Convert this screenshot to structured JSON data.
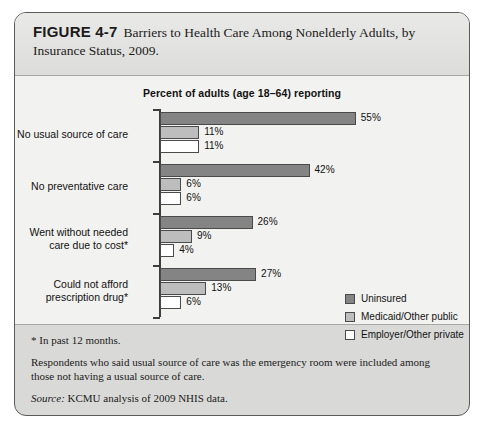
{
  "figure": {
    "number": "FIGURE 4-7",
    "caption": "Barriers to Health Care Among Nonelderly Adults, by Insurance Status, 2009."
  },
  "notes": {
    "footnote": "* In past 12 months.",
    "methodology": "Respondents who said usual source of care was the emergency room were included among those not having a usual source of care.",
    "source_label": "Source:",
    "source_text": "KCMU analysis of 2009 NHIS data."
  },
  "chart_data": {
    "type": "bar",
    "orientation": "horizontal",
    "title": "Percent of adults (age 18–64) reporting",
    "xlabel": "",
    "ylabel": "",
    "xlim": [
      0,
      60
    ],
    "grid": false,
    "legend_position": "right",
    "categories": [
      "No usual source of care",
      "No preventative care",
      "Went without needed care due to cost*",
      "Could not afford prescription drug*"
    ],
    "series": [
      {
        "name": "Uninsured",
        "color": "#848484",
        "values": [
          55,
          42,
          26,
          27
        ],
        "labels": [
          "55%",
          "42%",
          "26%",
          "27%"
        ]
      },
      {
        "name": "Medicaid/Other public",
        "color": "#bdbdbd",
        "values": [
          11,
          6,
          9,
          13
        ],
        "labels": [
          "11%",
          "6%",
          "9%",
          "13%"
        ]
      },
      {
        "name": "Employer/Other private",
        "color": "#ffffff",
        "values": [
          11,
          6,
          4,
          6
        ],
        "labels": [
          "11%",
          "6%",
          "4%",
          "6%"
        ]
      }
    ]
  }
}
